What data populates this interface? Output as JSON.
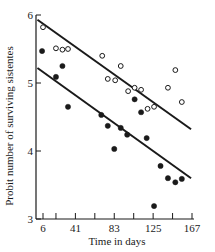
{
  "chart_data": {
    "type": "scatter",
    "title": "",
    "xlabel": "Time in days",
    "ylabel": "Probit number of surviving sistentes",
    "xlim": [
      6,
      167
    ],
    "ylim": [
      3,
      6
    ],
    "x_ticks": [
      6,
      41,
      83,
      125,
      167
    ],
    "x_minor_ticks": [
      20,
      62,
      104,
      146
    ],
    "y_ticks": [
      3,
      4,
      5,
      6
    ],
    "grid": false,
    "legend": null,
    "series": [
      {
        "name": "open circles",
        "marker": "open-circle",
        "points": [
          [
            6,
            5.82
          ],
          [
            20,
            5.51
          ],
          [
            27,
            5.49
          ],
          [
            33,
            5.5
          ],
          [
            70,
            5.4
          ],
          [
            76,
            5.06
          ],
          [
            84,
            5.04
          ],
          [
            90,
            5.25
          ],
          [
            98,
            4.88
          ],
          [
            105,
            4.93
          ],
          [
            112,
            4.9
          ],
          [
            119,
            4.62
          ],
          [
            126,
            4.65
          ],
          [
            141,
            4.93
          ],
          [
            149,
            5.19
          ],
          [
            156,
            4.72
          ]
        ],
        "fit_line": {
          "x": [
            0,
            166
          ],
          "y": [
            5.93,
            4.32
          ]
        }
      },
      {
        "name": "filled circles",
        "marker": "filled-circle",
        "points": [
          [
            5,
            5.47
          ],
          [
            20,
            5.09
          ],
          [
            27,
            5.25
          ],
          [
            33,
            4.65
          ],
          [
            69,
            4.53
          ],
          [
            76,
            4.37
          ],
          [
            83,
            4.03
          ],
          [
            90,
            4.34
          ],
          [
            97,
            4.24
          ],
          [
            105,
            4.76
          ],
          [
            112,
            4.57
          ],
          [
            118,
            4.19
          ],
          [
            126,
            3.19
          ],
          [
            133,
            3.78
          ],
          [
            141,
            3.6
          ],
          [
            149,
            3.54
          ],
          [
            156,
            3.59
          ]
        ],
        "fit_line": {
          "x": [
            0,
            166
          ],
          "y": [
            5.22,
            3.6
          ]
        }
      }
    ]
  },
  "colors": {
    "ink": "#1a1a1a",
    "background": "#ffffff"
  }
}
